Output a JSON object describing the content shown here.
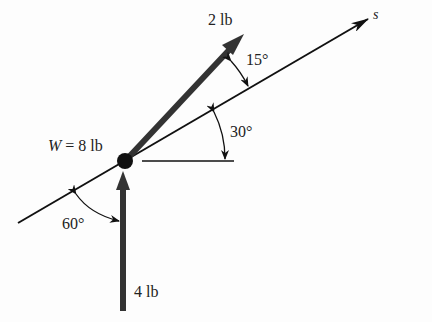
{
  "diagram": {
    "type": "free-body diagram",
    "axis": {
      "label": "s",
      "angle_from_horizontal_deg": 30
    },
    "body": {
      "label": "W = 8 lb",
      "weight_symbol": "W",
      "weight_value": "8 lb"
    },
    "forces": [
      {
        "name": "upper-force",
        "label": "2 lb",
        "angle_to_axis_label": "15°"
      },
      {
        "name": "vertical-force",
        "label": "4 lb",
        "direction": "up"
      }
    ],
    "angles": [
      {
        "label": "15°",
        "between": "2 lb force and s-axis"
      },
      {
        "label": "30°",
        "between": "s-axis and horizontal"
      },
      {
        "label": "60°",
        "between": "s-axis and 4 lb force"
      }
    ],
    "colors": {
      "line": "#111111",
      "force_arrow": "#333333",
      "background": "#fdfdfd"
    }
  }
}
